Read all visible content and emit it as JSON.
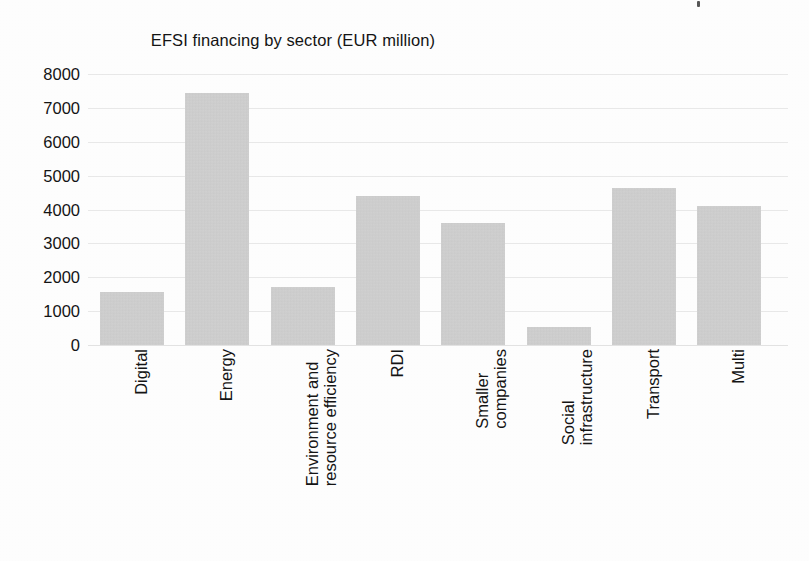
{
  "chart_data": {
    "type": "bar",
    "title": "EFSI financing by sector (EUR million)",
    "xlabel": "",
    "ylabel": "",
    "categories": [
      "Digital",
      "Energy",
      "Environment and\nresource efficiency",
      "RDI",
      "Smaller\ncompanies",
      "Social\ninfrastructure",
      "Transport",
      "Multi"
    ],
    "values": [
      1560,
      7430,
      1710,
      4400,
      3600,
      530,
      4630,
      4100
    ],
    "ylim": [
      0,
      8000
    ],
    "yticks": [
      0,
      1000,
      2000,
      3000,
      4000,
      5000,
      6000,
      7000,
      8000
    ],
    "ytick_labels": [
      "0",
      "1000",
      "2000",
      "3000",
      "4000",
      "5000",
      "6000",
      "7000",
      "8000"
    ],
    "grid": true,
    "legend": false,
    "bar_color": "#cacaca",
    "grid_color": "#e9e9e9",
    "text_color": "#141414",
    "background_color": "#ffffff"
  },
  "artifact": {
    "name": "scan-speck"
  }
}
